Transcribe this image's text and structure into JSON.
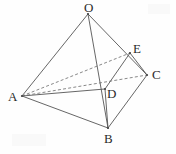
{
  "figure": {
    "type": "geometry-diagram",
    "width": 176,
    "height": 154,
    "background_color": "#fefefe",
    "stroke_color": "#555555",
    "label_color": "#2b2b2b",
    "points": [
      {
        "name": "O",
        "x": 88,
        "y": 14,
        "label": "O",
        "label_x": 84,
        "label_y": 1
      },
      {
        "name": "E",
        "x": 130,
        "y": 53,
        "label": "E",
        "label_x": 133,
        "label_y": 42
      },
      {
        "name": "C",
        "x": 147,
        "y": 75,
        "label": "C",
        "label_x": 152,
        "label_y": 68
      },
      {
        "name": "A",
        "x": 22,
        "y": 96,
        "label": "A",
        "label_x": 8,
        "label_y": 90
      },
      {
        "name": "D",
        "x": 105,
        "y": 89,
        "label": "D",
        "label_x": 107,
        "label_y": 87
      },
      {
        "name": "B",
        "x": 108,
        "y": 128,
        "label": "B",
        "label_x": 104,
        "label_y": 132
      }
    ],
    "solid_edges": [
      {
        "name": "edge-OA",
        "from": "O",
        "to": "A",
        "d": "M 88 14 L 22 96"
      },
      {
        "name": "edge-OB",
        "from": "O",
        "to": "B",
        "d": "M 88 14 L 108 128"
      },
      {
        "name": "edge-OC",
        "from": "O",
        "to": "C",
        "d": "M 88 14 L 147 75"
      },
      {
        "name": "edge-AB",
        "from": "A",
        "to": "B",
        "d": "M 22 96 L 108 128"
      },
      {
        "name": "edge-AD",
        "from": "A",
        "to": "D",
        "d": "M 22 96 L 105 89"
      },
      {
        "name": "edge-BC",
        "from": "B",
        "to": "C",
        "d": "M 108 128 L 147 75"
      },
      {
        "name": "edge-BD",
        "from": "B",
        "to": "D",
        "d": "M 108 128 L 105 89"
      },
      {
        "name": "edge-DE",
        "from": "D",
        "to": "E",
        "d": "M 105 89 L 130 53"
      },
      {
        "name": "edge-EC",
        "from": "E",
        "to": "C",
        "d": "M 130 53 L 147 75"
      }
    ],
    "dashed_edges": [
      {
        "name": "edge-AE",
        "from": "A",
        "to": "E",
        "d": "M 22 96 L 130 53"
      },
      {
        "name": "edge-AC",
        "from": "A",
        "to": "C",
        "d": "M 22 96 L 147 75"
      }
    ],
    "labels": [
      "O",
      "E",
      "C",
      "A",
      "D",
      "B"
    ]
  }
}
